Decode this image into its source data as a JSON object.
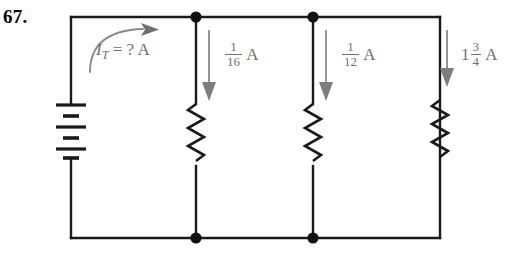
{
  "figure": {
    "problem_number": "67."
  },
  "source": {
    "label_text": "I",
    "subscript": "T",
    "equals": " = ? A",
    "full_text": "I_T = ? A",
    "arrow": "curved-arrow-right",
    "color": "#6f6f6f"
  },
  "battery": {
    "name": "multi-cell-battery",
    "cells": 3,
    "plates": 6
  },
  "branches": [
    {
      "id": "branch-1",
      "component": "resistor",
      "arrow": "down-arrow",
      "current": {
        "whole": "",
        "numerator": "1",
        "denominator": "16",
        "unit": "A",
        "display": "1/16 A"
      }
    },
    {
      "id": "branch-2",
      "component": "resistor",
      "arrow": "down-arrow",
      "current": {
        "whole": "",
        "numerator": "1",
        "denominator": "12",
        "unit": "A",
        "display": "1/12 A"
      }
    },
    {
      "id": "branch-3",
      "component": "resistor",
      "arrow": "down-arrow",
      "current": {
        "whole": "1",
        "numerator": "3",
        "denominator": "4",
        "unit": "A",
        "display": "1 3/4 A"
      }
    }
  ],
  "nodes": {
    "top": 2,
    "bottom": 2
  },
  "colors": {
    "wire": "#1a1a1a",
    "annotation": "#6f6f6f",
    "background": "#ffffff"
  }
}
